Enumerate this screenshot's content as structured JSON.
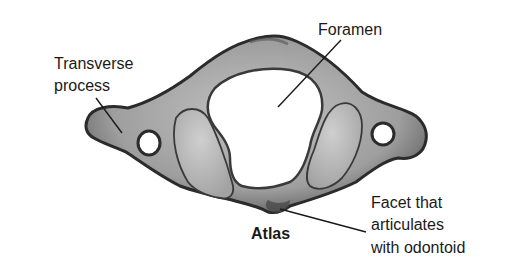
{
  "diagram": {
    "title": "Atlas",
    "labels": {
      "foramen": "Foramen",
      "transverse_line1": "Transverse",
      "transverse_line2": "process",
      "facet_line1": "Facet that",
      "facet_line2": "articulates",
      "facet_line3": "with odontoid"
    },
    "colors": {
      "background": "#ffffff",
      "bone_fill": "#a9a9a9",
      "bone_edge": "#2b2b2b",
      "facet_fill": "#bcbcbc",
      "text": "#1a1a1a",
      "leader_line": "#1a1a1a"
    }
  }
}
